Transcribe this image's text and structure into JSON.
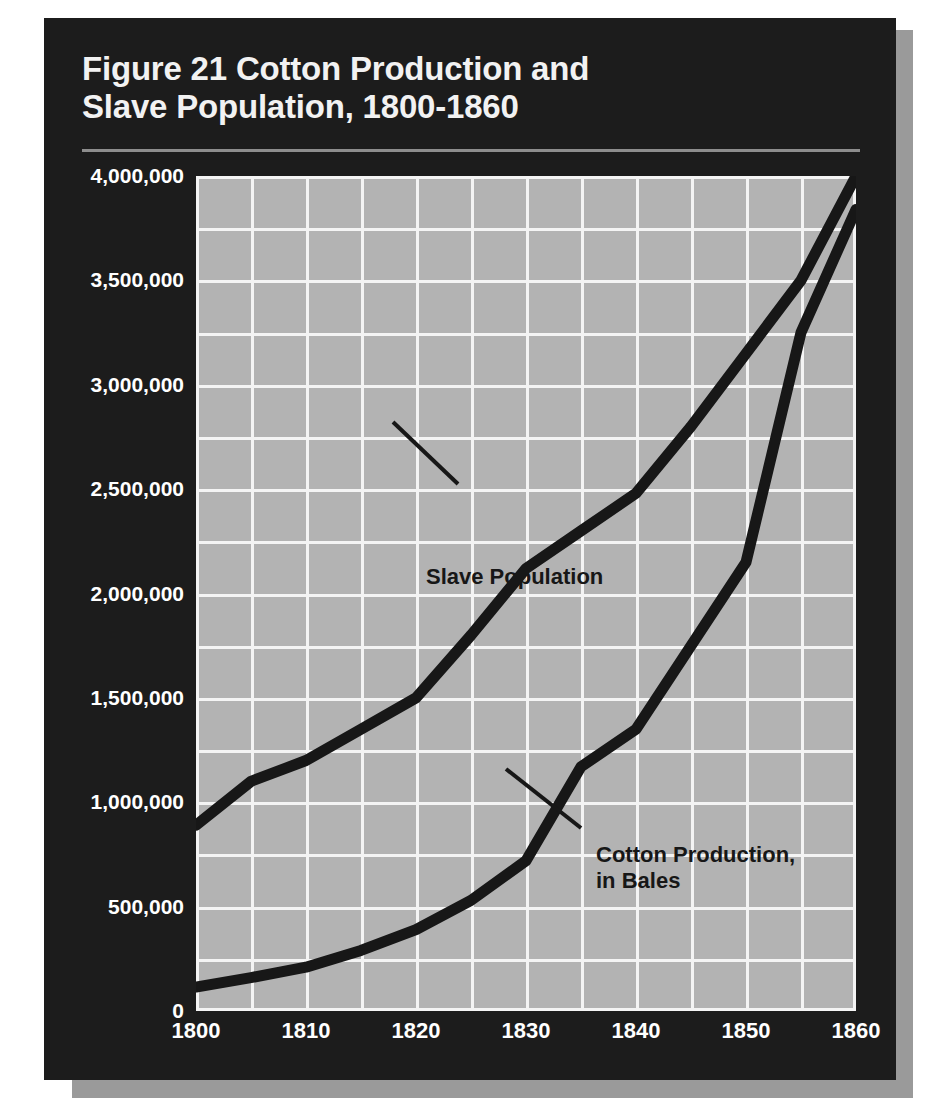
{
  "figure": {
    "title_line1": "Figure 21   Cotton Production and",
    "title_line2": "Slave Population, 1800-1860",
    "panel_color": "#1c1c1c",
    "plot_color": "#b3b3b3",
    "grid_color": "#f4f4f4",
    "line_color": "#171717",
    "label_color": "#ffffff",
    "shadow_color": "#9a9a9a"
  },
  "annotations": {
    "slave_label": "Slave Population",
    "cotton_label_line1": "Cotton Production,",
    "cotton_label_line2": "in Bales"
  },
  "chart_data": {
    "type": "line",
    "title": "Figure 21   Cotton Production and Slave Population, 1800-1860",
    "xlabel": "",
    "ylabel": "",
    "x": [
      1800,
      1805,
      1810,
      1815,
      1820,
      1825,
      1830,
      1835,
      1840,
      1845,
      1850,
      1855,
      1860
    ],
    "xlim": [
      1800,
      1860
    ],
    "ylim": [
      0,
      4000000
    ],
    "xticks": [
      1800,
      1810,
      1820,
      1830,
      1840,
      1850,
      1860
    ],
    "xticklabels": [
      "1800",
      "1810",
      "1820",
      "1830",
      "1840",
      "1850",
      "1860"
    ],
    "yticks": [
      0,
      500000,
      1000000,
      1500000,
      2000000,
      2500000,
      3000000,
      3500000,
      4000000
    ],
    "yticklabels": [
      "0",
      "500,000",
      "1,000,000",
      "1,500,000",
      "2,000,000",
      "2,500,000",
      "3,000,000",
      "3,500,000",
      "4,000,000"
    ],
    "grid": true,
    "grid_minor_x_step": 5,
    "grid_minor_y_step": 250000,
    "legend": "annotations",
    "series": [
      {
        "name": "Slave Population",
        "values": [
          890000,
          1100000,
          1200000,
          1350000,
          1500000,
          1800000,
          2120000,
          2300000,
          2480000,
          2800000,
          3150000,
          3500000,
          4000000
        ]
      },
      {
        "name": "Cotton Production, in Bales",
        "values": [
          115000,
          160000,
          210000,
          290000,
          390000,
          530000,
          720000,
          1170000,
          1350000,
          1750000,
          2150000,
          3250000,
          3840000
        ]
      }
    ]
  },
  "y_axis_labels": [
    "4,000,000",
    "3,500,000",
    "3,000,000",
    "2,500,000",
    "2,000,000",
    "1,500,000",
    "1,000,000",
    "500,000",
    "0"
  ],
  "x_axis_labels": [
    "1800",
    "1810",
    "1820",
    "1830",
    "1840",
    "1850",
    "1860"
  ]
}
